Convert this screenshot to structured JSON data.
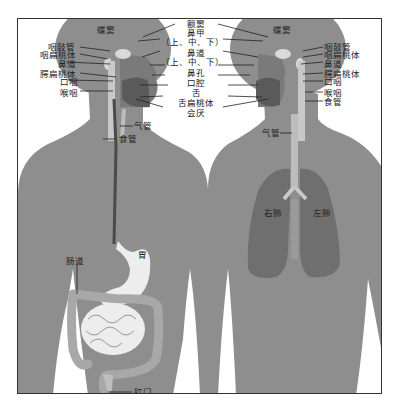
{
  "diagram": {
    "title": "",
    "colors": {
      "body": "#8e8e8e",
      "head_dark": "#7a7a7a",
      "lung": "#6f6f6f",
      "organ_light": "#ededed",
      "line": "#222222",
      "frame": "#333333"
    },
    "left_figure": {
      "description": "digestive system",
      "head_labels": {
        "sinus": "蝶窦",
        "eustachian_tube": "咽鼓管",
        "pharyngeal_tonsil": "咽扁桃体",
        "nasal_passage": "鼻道",
        "palatine_tonsil": "腭扁桃体",
        "oropharynx": "口咽",
        "laryngopharynx": "喉咽"
      },
      "body_labels": {
        "trachea": "气管",
        "esophagus": "食管",
        "stomach": "胃",
        "intestine": "肠道",
        "anus": "肛门"
      }
    },
    "center_labels": {
      "frontal_sinus": "额窦",
      "nasal_concha": "鼻甲",
      "concha_sub": "（上、中、下）",
      "nasal_meatus": "鼻道",
      "meatus_sub": "（上、中、下）",
      "nostril": "鼻孔",
      "oral_cavity": "口腔",
      "tongue": "舌",
      "lingual_tonsil": "舌扁桃体",
      "epiglottis": "会厌"
    },
    "right_figure": {
      "description": "respiratory system",
      "head_labels": {
        "sinus": "蝶窦",
        "eustachian_tube": "咽鼓管",
        "pharyngeal_tonsil": "咽扁桃体",
        "nasal_passage": "鼻道",
        "palatine_tonsil": "腭扁桃体",
        "oropharynx": "口咽",
        "laryngopharynx": "喉咽",
        "esophagus": "食管"
      },
      "body_labels": {
        "trachea": "气管",
        "right_lung": "右肺",
        "left_lung": "左肺"
      }
    }
  }
}
